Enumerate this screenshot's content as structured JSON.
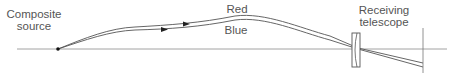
{
  "diagram": {
    "labels": {
      "source": [
        "Composite",
        "source"
      ],
      "red": "Red",
      "blue": "Blue",
      "telescope": [
        "Receiving",
        "telescope"
      ]
    },
    "colors": {
      "line": "#555555",
      "background": "#ffffff"
    },
    "elements": {
      "optical_axis": "horizontal line",
      "source_point": "black dot",
      "ray_red": "upper curved ray with arrow",
      "ray_blue": "lower curved ray with arrow",
      "lens": "biconcave lens",
      "image_plane": "vertical line"
    }
  }
}
